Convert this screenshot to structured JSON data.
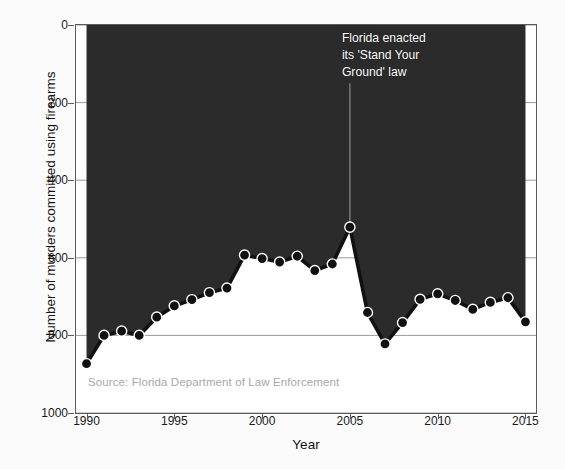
{
  "chart_data": {
    "type": "area",
    "title": "",
    "xlabel": "Year",
    "ylabel": "Number of murders committed using firearms",
    "xlim": [
      1989.4,
      2015.6
    ],
    "ylim": [
      1000,
      0
    ],
    "y_inverted": true,
    "grid": true,
    "legend": null,
    "source_note": "Source: Florida Department of Law Enforcement",
    "xticks": [
      {
        "value": 1990,
        "label": "1990"
      },
      {
        "value": 1995,
        "label": "1995"
      },
      {
        "value": 2000,
        "label": "2000"
      },
      {
        "value": 2005,
        "label": "2005"
      },
      {
        "value": 2010,
        "label": "2010"
      },
      {
        "value": 2015,
        "label": "2015"
      }
    ],
    "yticks": [
      {
        "value": 0,
        "label": "0"
      },
      {
        "value": 200,
        "label": "200"
      },
      {
        "value": 400,
        "label": "400"
      },
      {
        "value": 600,
        "label": "600"
      },
      {
        "value": 800,
        "label": "800"
      },
      {
        "value": 1000,
        "label": "1000"
      }
    ],
    "x": [
      1990,
      1991,
      1992,
      1993,
      1994,
      1995,
      1996,
      1997,
      1998,
      1999,
      2000,
      2001,
      2002,
      2003,
      2004,
      2005,
      2006,
      2007,
      2008,
      2009,
      2010,
      2011,
      2012,
      2013,
      2014,
      2015
    ],
    "values": [
      873,
      800,
      789,
      800,
      753,
      724,
      708,
      690,
      678,
      593,
      602,
      611,
      596,
      633,
      616,
      521,
      741,
      822,
      767,
      707,
      693,
      710,
      733,
      715,
      703,
      765
    ],
    "annotations": [
      {
        "text_lines": [
          "2005",
          "Florida enacted",
          "its 'Stand Your",
          "Ground' law"
        ],
        "x": 2005,
        "y": 521,
        "pointer": true
      }
    ],
    "style": {
      "fill_color": "#2b2b2b",
      "line_color": "#111111",
      "marker_face": "#111111",
      "marker_edge": "#ffffff",
      "grid_color": "#9a9a9a",
      "axis_color": "#5a5a5a",
      "annotation_color": "#ffffff",
      "source_color": "#a8a8a8"
    }
  }
}
